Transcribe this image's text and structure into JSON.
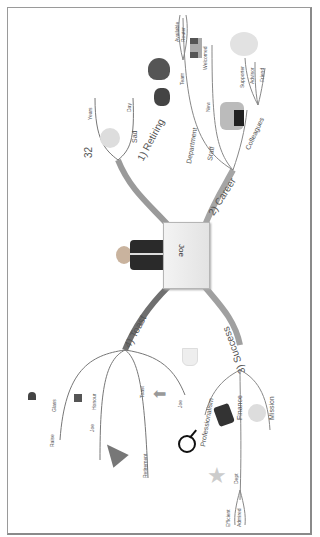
{
  "central": {
    "label": "Joe",
    "image": "businessman-holding-sign"
  },
  "branches": [
    {
      "label": "1) Retiring",
      "color": "#9a9a9a",
      "children": [
        {
          "label": "32",
          "children": [
            {
              "label": "Years"
            }
          ]
        },
        {
          "label": "Sad",
          "icon": "sad-face-icon",
          "children": [
            {
              "label": "Day"
            }
          ]
        }
      ]
    },
    {
      "label": "2) Career",
      "color": "#9a9a9a",
      "children": [
        {
          "label": "Department",
          "children": [
            {
              "label": "Team",
              "children": [
                {
                  "label": "Available"
                },
                {
                  "label": "Router"
                }
              ]
            }
          ]
        },
        {
          "label": "Staff",
          "children": [
            {
              "label": "New"
            },
            {
              "label": "Welcomed"
            }
          ]
        },
        {
          "label": "Colleagues",
          "icon": "people-icon",
          "children": [
            {
              "label": "Supporter"
            },
            {
              "label": "Advisor"
            },
            {
              "label": "Friend"
            }
          ]
        }
      ]
    },
    {
      "label": "3) Success",
      "color": "#9a9a9a",
      "children": [
        {
          "label": "Professionalism",
          "icon": "magnifier-icon"
        },
        {
          "label": "Finance",
          "icon": "money-icon",
          "children": [
            {
              "label": "Dept",
              "icon": "star-icon",
              "children": [
                {
                  "label": "Efficient"
                },
                {
                  "label": "Admired"
                }
              ]
            }
          ]
        },
        {
          "label": "Mission",
          "icon": "smiley-icon"
        }
      ]
    },
    {
      "label": "4) Toast",
      "color": "#777777",
      "children": [
        {
          "label": "Glass",
          "icon": "glass-icon",
          "children": [
            {
              "label": "Raise"
            }
          ]
        },
        {
          "label": "Honour",
          "icon": "medal-icon",
          "children": [
            {
              "label": "Joe"
            }
          ]
        },
        {
          "label": "Toast",
          "icon": "arrow-icon",
          "children": [
            {
              "label": "Retirement",
              "icon": "party-hat-icon"
            }
          ]
        },
        {
          "label": "Joe",
          "icon": "trophy-icon"
        }
      ]
    }
  ],
  "decorations": [
    "heart-icon",
    "flowers-icon",
    "brain-icon",
    "welcomed-icon"
  ]
}
